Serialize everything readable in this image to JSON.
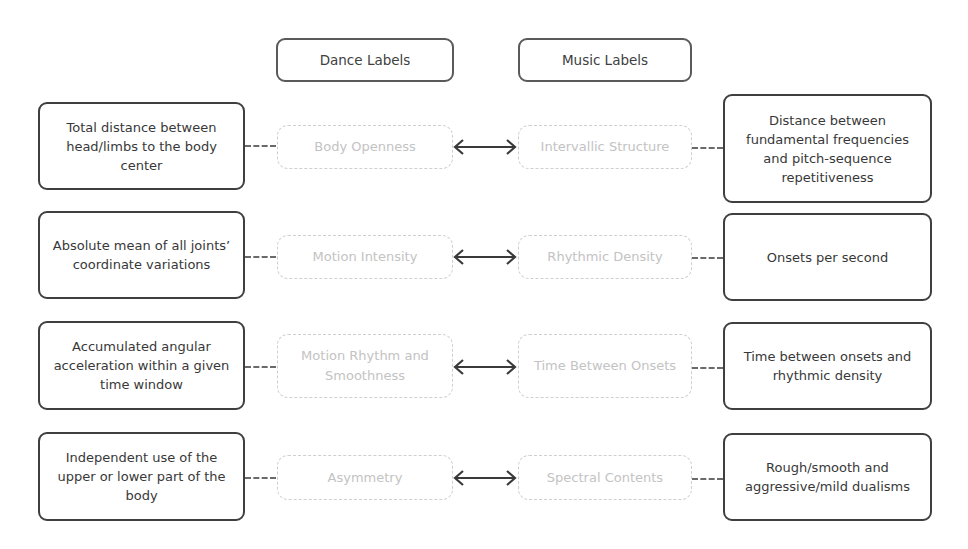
{
  "headers": {
    "dance": "Dance Labels",
    "music": "Music Labels"
  },
  "rows": [
    {
      "dance_description": "Total distance between head/limbs to the body center",
      "dance_feature": "Body Openness",
      "music_feature": "Intervallic Structure",
      "music_description": "Distance between fundamental frequencies and pitch-sequence repetitiveness"
    },
    {
      "dance_description": "Absolute mean of all joints’ coordinate variations",
      "dance_feature": "Motion Intensity",
      "music_feature": "Rhythmic Density",
      "music_description": "Onsets per second"
    },
    {
      "dance_description": "Accumulated angular acceleration within a given time window",
      "dance_feature": "Motion Rhythm and Smoothness",
      "music_feature": "Time Between Onsets",
      "music_description": "Time between onsets and rhythmic density"
    },
    {
      "dance_description": "Independent use of the upper or lower part of the body",
      "dance_feature": "Asymmetry",
      "music_feature": "Spectral Contents",
      "music_description": "Rough/smooth and aggressive/mild dualisms"
    }
  ],
  "connector_icon": "double-headed-arrow-icon"
}
